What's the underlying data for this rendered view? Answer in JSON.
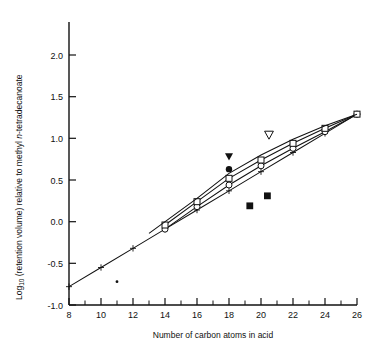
{
  "chart_data": {
    "type": "line",
    "title": "",
    "xlabel": "Number of carbon atoms in acid",
    "ylabel_parts": {
      "pre": "Log",
      "sub": "10",
      "mid": " (retention volume) relative to methyl ",
      "ital": "n",
      "post": "-tetradecanoate"
    },
    "ylabel": "Log10 (retention volume) relative to methyl n-tetradecanoate",
    "xlim": [
      8,
      26
    ],
    "ylim": [
      -1.0,
      2.3
    ],
    "grid": false,
    "legend": "none",
    "xticks": [
      8,
      10,
      12,
      14,
      16,
      18,
      20,
      22,
      24,
      26
    ],
    "xtick_labels": [
      "8",
      "10",
      "12",
      "14",
      "16",
      "18",
      "20",
      "22",
      "24",
      "26"
    ],
    "xminor_ticks": [
      9,
      11,
      13,
      15,
      17,
      19,
      21,
      23,
      25
    ],
    "yticks": [
      -1.0,
      -0.5,
      0.0,
      0.5,
      1.0,
      1.5,
      2.0
    ],
    "ytick_labels": [
      "-1.0",
      "-0.5",
      "0.0",
      "0.5",
      "1.0",
      "1.5",
      "2.0"
    ],
    "series": [
      {
        "name": "calibration-line-1",
        "style": "solid-with-cross-markers",
        "marker": "plus",
        "x": [
          8,
          10,
          12,
          14,
          16,
          18,
          20,
          22,
          24,
          26
        ],
        "y": [
          -0.78,
          -0.55,
          -0.32,
          -0.09,
          0.14,
          0.37,
          0.6,
          0.83,
          1.06,
          1.29
        ]
      },
      {
        "name": "calibration-line-2",
        "style": "solid-with-open-circle-markers",
        "marker": "open-circle",
        "x": [
          14,
          16,
          18,
          20,
          22,
          24,
          26
        ],
        "y": [
          -0.09,
          0.18,
          0.44,
          0.67,
          0.88,
          1.08,
          1.29
        ]
      },
      {
        "name": "calibration-line-3",
        "style": "solid-with-open-square-markers",
        "marker": "open-square",
        "x": [
          14,
          16,
          18,
          20,
          22,
          24,
          26
        ],
        "y": [
          -0.04,
          0.24,
          0.52,
          0.74,
          0.94,
          1.12,
          1.29
        ]
      },
      {
        "name": "calibration-line-4",
        "style": "solid-plain",
        "marker": "none",
        "x": [
          13,
          16,
          18,
          20,
          22,
          24,
          26
        ],
        "y": [
          -0.14,
          0.28,
          0.58,
          0.8,
          0.99,
          1.15,
          1.29
        ]
      }
    ],
    "points": [
      {
        "name": "filled-triangle-down",
        "marker": "filled-triangle-down",
        "x": 18.0,
        "y": 0.78
      },
      {
        "name": "filled-circle",
        "marker": "filled-circle",
        "x": 18.0,
        "y": 0.63
      },
      {
        "name": "open-triangle-down",
        "marker": "open-triangle-down",
        "x": 20.5,
        "y": 1.04
      },
      {
        "name": "filled-square-a",
        "marker": "filled-square",
        "x": 20.4,
        "y": 0.31
      },
      {
        "name": "filled-square-b",
        "marker": "filled-square",
        "x": 19.3,
        "y": 0.19
      },
      {
        "name": "small-dot",
        "marker": "small-dot",
        "x": 11.0,
        "y": -0.72
      }
    ]
  }
}
